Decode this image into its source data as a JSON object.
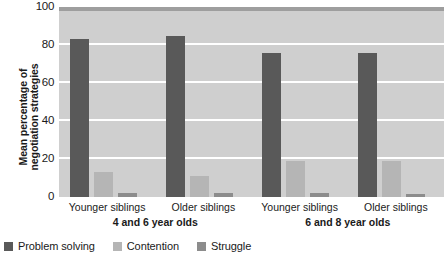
{
  "chart_data": {
    "type": "bar",
    "title": "",
    "xlabel": "",
    "ylabel": "Mean percentage of negotiation strategies",
    "ylabel_line1": "Mean percentage of",
    "ylabel_line2": "negotiation strategies",
    "ylim": [
      0,
      100
    ],
    "yticks": [
      0,
      20,
      40,
      60,
      80,
      100
    ],
    "ytick_labels": [
      "0",
      "20",
      "40",
      "60",
      "80",
      "100"
    ],
    "grid": true,
    "grid_axis": "y",
    "legend_position": "bottom-left",
    "categories": [
      "Younger siblings",
      "Older siblings",
      "Younger siblings",
      "Older siblings"
    ],
    "supergroups": [
      {
        "label": "4 and 6 year olds",
        "categories": [
          "Younger siblings",
          "Older siblings"
        ]
      },
      {
        "label": "6 and 8 year olds",
        "categories": [
          "Younger siblings",
          "Older siblings"
        ]
      }
    ],
    "series": [
      {
        "name": "Problem solving",
        "color": "#595959",
        "values": [
          83,
          85,
          76,
          76
        ]
      },
      {
        "name": "Contention",
        "color": "#b5b5b5",
        "values": [
          13,
          11,
          19,
          19
        ]
      },
      {
        "name": "Struggle",
        "color": "#8c8c8c",
        "values": [
          2,
          2,
          2,
          1.5
        ]
      }
    ]
  },
  "legend": {
    "items": [
      {
        "label": "Problem solving",
        "color": "#595959"
      },
      {
        "label": "Contention",
        "color": "#b5b5b5"
      },
      {
        "label": "Struggle",
        "color": "#8c8c8c"
      }
    ]
  },
  "colors": {
    "plot_background": "#cfcfcf",
    "plot_top_band": "#9e9e9e",
    "gridline": "#ffffff",
    "page_background": "#ffffff",
    "text": "#1a1a1a"
  }
}
